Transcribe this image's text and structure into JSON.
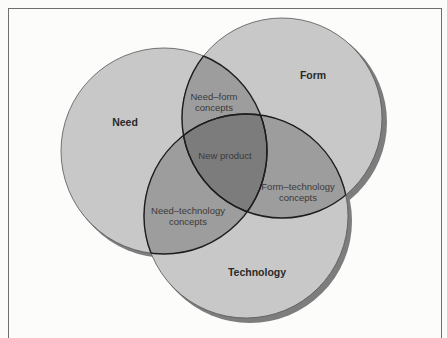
{
  "diagram": {
    "type": "venn",
    "sets": [
      {
        "id": "need",
        "label": "Need"
      },
      {
        "id": "form",
        "label": "Form"
      },
      {
        "id": "technology",
        "label": "Technology"
      }
    ],
    "intersections": {
      "need_form": [
        "Need–form",
        "concepts"
      ],
      "form_technology": [
        "Form–technology",
        "concepts"
      ],
      "need_technology": [
        "Need–technology",
        "concepts"
      ],
      "all": "New product"
    },
    "colors": {
      "circle_fill": "#c8c8c8",
      "pair_overlap": "#9d9d9d",
      "triple_overlap": "#7c7c7c",
      "shadow": "#7d7d7d",
      "outline": "#1e1e1e"
    }
  }
}
